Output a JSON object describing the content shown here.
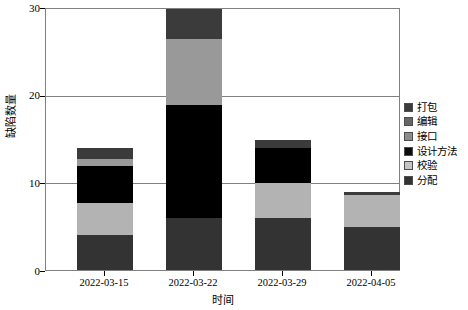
{
  "chart_data": {
    "type": "bar",
    "stacked": true,
    "title": "",
    "xlabel": "时间",
    "ylabel": "缺陷数量",
    "categories": [
      "2022-03-15",
      "2022-03-22",
      "2022-03-29",
      "2022-04-05"
    ],
    "ylim": [
      0,
      30
    ],
    "yticks": [
      0,
      10,
      20,
      30
    ],
    "ytick_labels": [
      "0",
      "10",
      "20",
      "30"
    ],
    "grid": "horizontal",
    "legend_position": "right",
    "series": [
      {
        "name": "分配",
        "color": "#333333",
        "values": [
          4,
          6,
          6,
          5
        ]
      },
      {
        "name": "校验",
        "color": "#b3b3b3",
        "values": [
          3.7,
          0,
          4,
          3.6
        ]
      },
      {
        "name": "设计方法",
        "color": "#000000",
        "values": [
          4.3,
          13,
          4,
          0
        ]
      },
      {
        "name": "接口",
        "color": "#999999",
        "values": [
          0.8,
          7.5,
          0,
          0
        ]
      },
      {
        "name": "编辑",
        "color": "#666666",
        "values": [
          0,
          0,
          0,
          0
        ]
      },
      {
        "name": "打包",
        "color": "#3b3b3b",
        "values": [
          1.2,
          3.5,
          1,
          0.4
        ]
      }
    ],
    "totals": [
      14,
      30,
      15,
      9
    ]
  },
  "legend": {
    "items": [
      {
        "label": "打包",
        "color": "#3b3b3b"
      },
      {
        "label": "编辑",
        "color": "#666666"
      },
      {
        "label": "接口",
        "color": "#8c8c8c"
      },
      {
        "label": "设计方法",
        "color": "#0d0d0d"
      },
      {
        "label": "校验",
        "color": "#c4c4c4"
      },
      {
        "label": "分配",
        "color": "#333333"
      }
    ]
  },
  "axes": {
    "y_title": "缺陷数量",
    "x_title": "时间",
    "y_tick_labels": [
      "30",
      "20",
      "10",
      "0"
    ],
    "x_tick_labels": [
      "2022-03-15",
      "2022-03-22",
      "2022-03-29",
      "2022-04-05"
    ]
  },
  "colors": {
    "frame": "#808080",
    "grid": "#808080",
    "background": "#ffffff",
    "text": "#000000"
  }
}
